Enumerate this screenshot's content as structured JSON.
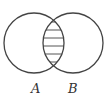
{
  "diagram": {
    "type": "venn",
    "sets": [
      {
        "label": "A",
        "cx": 34,
        "cy": 43,
        "r": 30
      },
      {
        "label": "B",
        "cx": 73,
        "cy": 43,
        "r": 30
      }
    ],
    "shaded_region": "A ∩ B",
    "shading_style": "horizontal-lines",
    "colors": {
      "stroke": "#444444",
      "hatch": "#555555",
      "background": "#ffffff"
    }
  }
}
